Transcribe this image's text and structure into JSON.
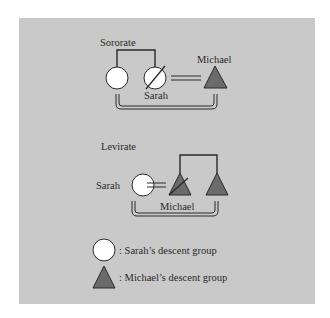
{
  "diagram": {
    "colors": {
      "background": "#ffffff",
      "panel": "#c9c9c9",
      "line": "#2a2a2a",
      "circle_fill": "#ffffff",
      "triangle_fill": "#6b6b6b"
    },
    "sororate": {
      "title": "Sororate",
      "sister_label": "",
      "wife_label": "Sarah",
      "husband_label": "Michael"
    },
    "levirate": {
      "title": "Levirate",
      "wife_label": "Sarah",
      "husband_label": "Michael"
    },
    "legend": [
      {
        "symbol": "circle",
        "text": ":  Sarah’s descent group"
      },
      {
        "symbol": "triangle",
        "text": ":  Michael’s descent group"
      }
    ]
  }
}
